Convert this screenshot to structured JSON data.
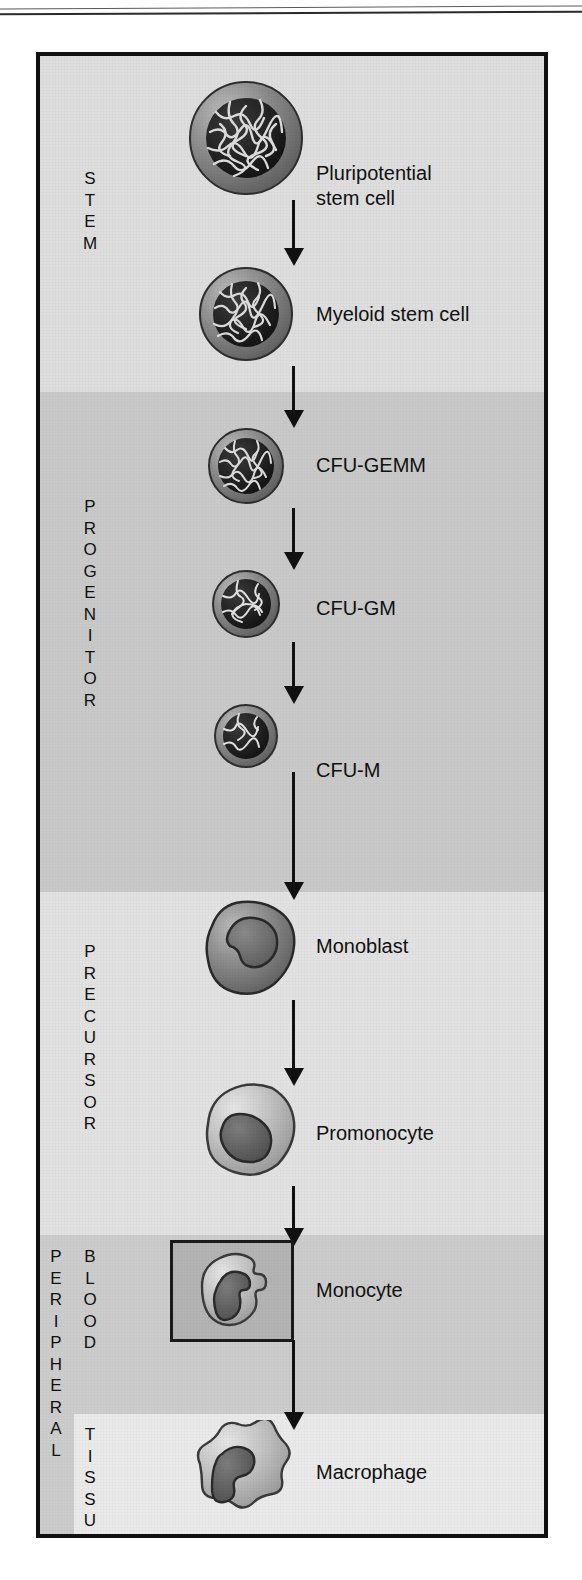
{
  "figure": {
    "background_color": "#d8d8d8",
    "frame_color": "#111111"
  },
  "compartments": [
    {
      "id": "stem",
      "label": "S\nT\nE\nM",
      "band_color": "#dedede"
    },
    {
      "id": "progenitor",
      "label": "P\nR\nO\nG\nE\nN\nI\nT\nO\nR",
      "band_color": "#c9c9c9"
    },
    {
      "id": "precursor",
      "label": "P\nR\nE\nC\nU\nR\nS\nO\nR",
      "band_color": "#e2e2e2"
    },
    {
      "id": "peripheral",
      "label": "P\nE\nR\nI\nP\nH\nE\nR\nA\nL",
      "band_color": "#cccccc"
    },
    {
      "id": "blood",
      "label": "B\nL\nO\nO\nD",
      "band_color": "#cccccc"
    },
    {
      "id": "tissue",
      "label": "T\nI\nS\nS\nU\nE",
      "band_color": "#eaeaea"
    }
  ],
  "stages": [
    {
      "id": "pluripotential-stem-cell",
      "label": "Pluripotential\nstem cell",
      "cell_type": "nucleated-round-large",
      "compartment": "stem"
    },
    {
      "id": "myeloid-stem-cell",
      "label": "Myeloid stem cell",
      "cell_type": "nucleated-round-medium",
      "compartment": "stem"
    },
    {
      "id": "cfu-gemm",
      "label": "CFU-GEMM",
      "cell_type": "nucleated-round-small",
      "compartment": "progenitor"
    },
    {
      "id": "cfu-gm",
      "label": "CFU-GM",
      "cell_type": "nucleated-round-small",
      "compartment": "progenitor"
    },
    {
      "id": "cfu-m",
      "label": "CFU-M",
      "cell_type": "nucleated-round-small",
      "compartment": "progenitor"
    },
    {
      "id": "monoblast",
      "label": "Monoblast",
      "cell_type": "monoblast-blob",
      "compartment": "precursor"
    },
    {
      "id": "promonocyte",
      "label": "Promonocyte",
      "cell_type": "promonocyte-blob",
      "compartment": "precursor"
    },
    {
      "id": "monocyte",
      "label": "Monocyte",
      "cell_type": "monocyte-kidney",
      "compartment": "blood",
      "highlighted": true
    },
    {
      "id": "macrophage",
      "label": "Macrophage",
      "cell_type": "macrophage-blob",
      "compartment": "tissue"
    }
  ],
  "arrows": {
    "count": 8,
    "color": "#111111",
    "direction": "down"
  }
}
